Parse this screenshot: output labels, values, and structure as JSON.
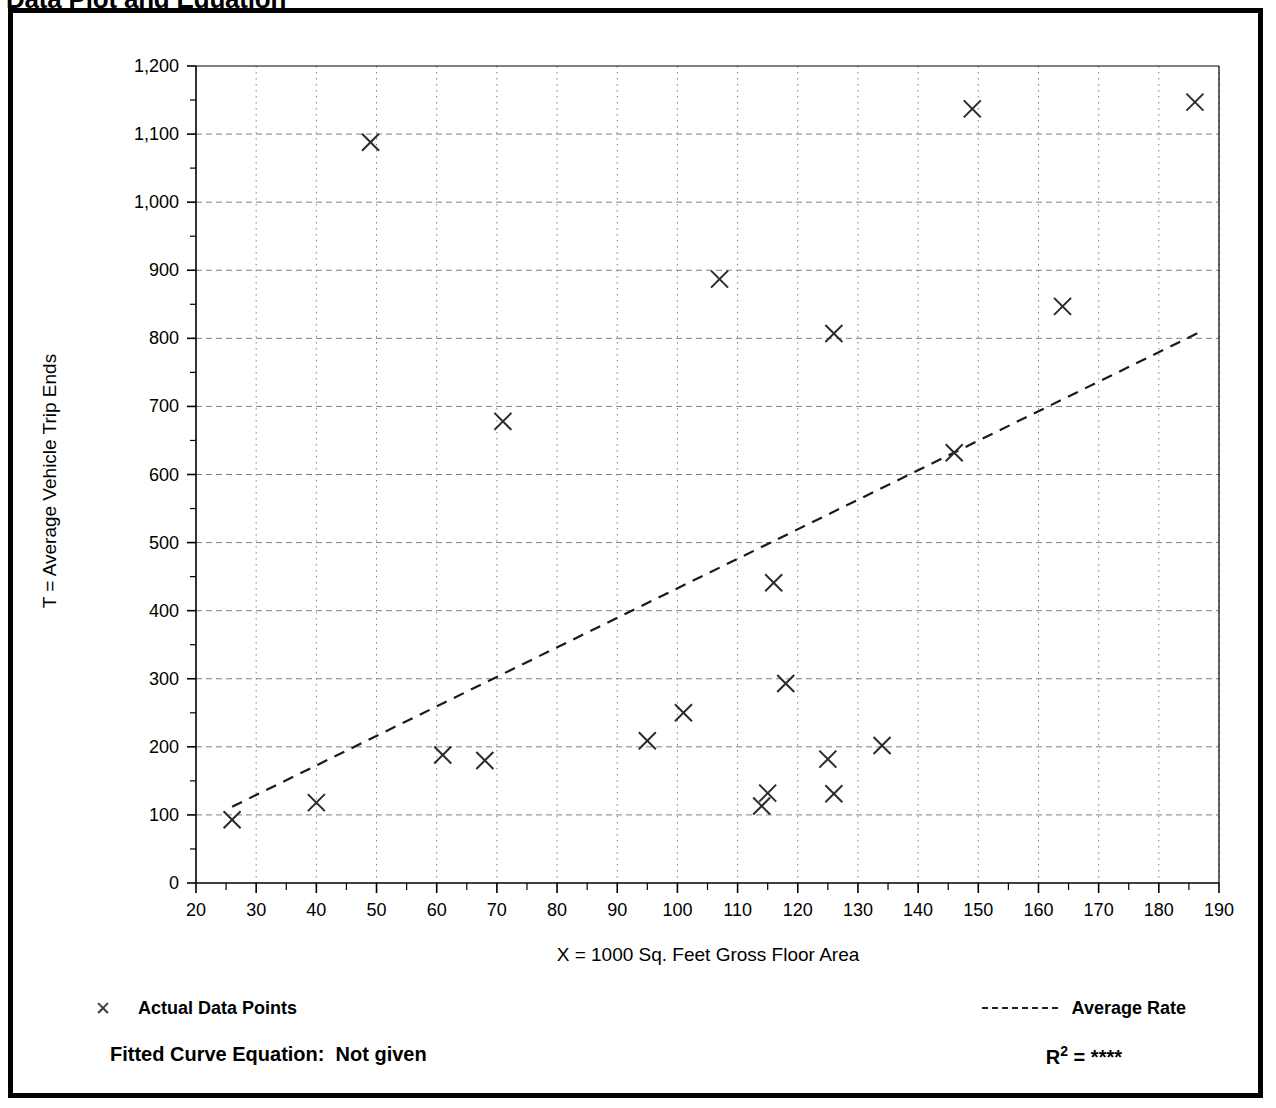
{
  "title": "Data Plot and Equation",
  "axes": {
    "x": {
      "label": "X = 1000 Sq. Feet Gross Floor Area",
      "min": 20,
      "max": 190,
      "major_step": 10,
      "minor_step": 5,
      "ticks": [
        20,
        30,
        40,
        50,
        60,
        70,
        80,
        90,
        100,
        110,
        120,
        130,
        140,
        150,
        160,
        170,
        180,
        190
      ],
      "tick_labels": [
        "20",
        "30",
        "40",
        "50",
        "60",
        "70",
        "80",
        "90",
        "100",
        "110",
        "120",
        "130",
        "140",
        "150",
        "160",
        "170",
        "180",
        "190"
      ]
    },
    "y": {
      "label": "T = Average Vehicle Trip Ends",
      "min": 0,
      "max": 1200,
      "major_step": 100,
      "minor_step": 50,
      "ticks": [
        0,
        100,
        200,
        300,
        400,
        500,
        600,
        700,
        800,
        900,
        1000,
        1100,
        1200
      ],
      "tick_labels": [
        "0",
        "100",
        "200",
        "300",
        "400",
        "500",
        "600",
        "700",
        "800",
        "900",
        "1,000",
        "1,100",
        "1,200"
      ]
    }
  },
  "legend": {
    "actual_points_label": "Actual Data Points",
    "actual_points_icon": "x-marker-icon",
    "average_rate_label": "Average Rate",
    "average_rate_icon": "dashed-line-icon"
  },
  "footer": {
    "fitted_curve_label": "Fitted Curve Equation:",
    "fitted_curve_value": "Not given",
    "r_squared_label": "R",
    "r_squared_exponent": "2",
    "r_squared_equals": "=",
    "r_squared_value": "****"
  },
  "colors": {
    "frame": "#000000",
    "axis": "#000000",
    "grid": "#808080",
    "marker": "#2b2b2b",
    "trend_line": "#1a1a1a",
    "background": "#ffffff"
  },
  "chart_data": {
    "type": "scatter",
    "title": "Data Plot and Equation",
    "xlabel": "X = 1000 Sq. Feet Gross Floor Area",
    "ylabel": "T = Average Vehicle Trip Ends",
    "xlim": [
      20,
      190
    ],
    "ylim": [
      0,
      1200
    ],
    "grid": true,
    "legend_position": "below-plot",
    "series": [
      {
        "name": "Actual Data Points",
        "type": "scatter",
        "marker": "x",
        "points": [
          {
            "x": 26,
            "y": 93
          },
          {
            "x": 40,
            "y": 118
          },
          {
            "x": 49,
            "y": 1088
          },
          {
            "x": 61,
            "y": 188
          },
          {
            "x": 68,
            "y": 180
          },
          {
            "x": 71,
            "y": 678
          },
          {
            "x": 95,
            "y": 209
          },
          {
            "x": 101,
            "y": 250
          },
          {
            "x": 107,
            "y": 887
          },
          {
            "x": 114,
            "y": 113
          },
          {
            "x": 115,
            "y": 132
          },
          {
            "x": 116,
            "y": 441
          },
          {
            "x": 118,
            "y": 293
          },
          {
            "x": 125,
            "y": 182
          },
          {
            "x": 126,
            "y": 131
          },
          {
            "x": 126,
            "y": 807
          },
          {
            "x": 134,
            "y": 202
          },
          {
            "x": 146,
            "y": 632
          },
          {
            "x": 149,
            "y": 1137
          },
          {
            "x": 164,
            "y": 847
          },
          {
            "x": 186,
            "y": 1147
          }
        ]
      },
      {
        "name": "Average Rate",
        "type": "line",
        "style": "dashed",
        "endpoints": [
          {
            "x": 26,
            "y": 112
          },
          {
            "x": 187,
            "y": 810
          }
        ]
      }
    ]
  }
}
